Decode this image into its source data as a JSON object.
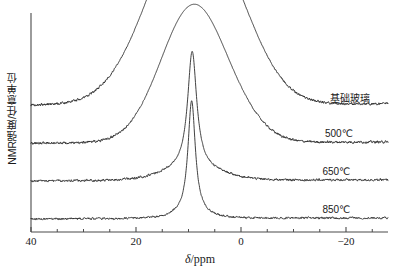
{
  "chart_data": {
    "type": "line",
    "title": "",
    "xlabel": "δ/ppm",
    "ylabel": "NMR强度/任意单位",
    "xlim": [
      40,
      -28
    ],
    "xticks": [
      40,
      20,
      0,
      -20
    ],
    "xticklabels": [
      "40",
      "20",
      "0",
      "−20"
    ],
    "xminor_step": 5,
    "grid": false,
    "legend_position": "inline-right",
    "axis_style": "left-and-bottom-spines",
    "series": [
      {
        "name": "基础玻璃",
        "label": "基础玻璃",
        "label_x_ppm": -17.0,
        "baseline_offset": 3.0,
        "peak_center_ppm": 9.2,
        "peak_height": 4.9,
        "peak_width_ppm": 8.2,
        "shoulder_center_ppm": -0.5,
        "shoulder_height": 0.28,
        "shoulder_width_ppm": 5.0,
        "noise_amplitude": 0.055,
        "line_type": "broad"
      },
      {
        "name": "500℃",
        "label": "500℃",
        "label_x_ppm": -16.0,
        "baseline_offset": 2.0,
        "peak_center_ppm": 9.0,
        "peak_height": 3.62,
        "peak_width_ppm": 6.2,
        "shoulder_center_ppm": -1.0,
        "shoulder_height": 0.22,
        "shoulder_width_ppm": 4.5,
        "noise_amplitude": 0.055,
        "line_type": "broad"
      },
      {
        "name": "650℃",
        "label": "650℃",
        "label_x_ppm": -15.5,
        "baseline_offset": 1.0,
        "peak_center_ppm": 9.3,
        "peak_height": 3.1,
        "peak_width_ppm": 1.05,
        "shoulder_center_ppm": 9.3,
        "shoulder_height": 0.3,
        "shoulder_width_ppm": 5.5,
        "noise_amplitude": 0.05,
        "line_type": "sharp"
      },
      {
        "name": "850℃",
        "label": "850℃",
        "label_x_ppm": -15.5,
        "baseline_offset": 0.0,
        "peak_center_ppm": 9.4,
        "peak_height": 3.0,
        "peak_width_ppm": 0.85,
        "shoulder_center_ppm": 9.4,
        "shoulder_height": 0.1,
        "shoulder_width_ppm": 3.0,
        "noise_amplitude": 0.045,
        "line_type": "sharp"
      }
    ],
    "colors": {
      "line": "#2b2b2b",
      "axis": "#4a4a4a",
      "text": "#1a1a1a",
      "background": "#ffffff"
    }
  },
  "axis": {
    "x_tick_labels": [
      "40",
      "20",
      "0",
      "−20"
    ],
    "x_title_delta": "δ",
    "x_title_rest": "/ppm",
    "y_title": "NMR强度/任意单位"
  },
  "labels": {
    "trace_0": "基础玻璃",
    "trace_1": "500℃",
    "trace_2": "650℃",
    "trace_3": "850℃"
  }
}
